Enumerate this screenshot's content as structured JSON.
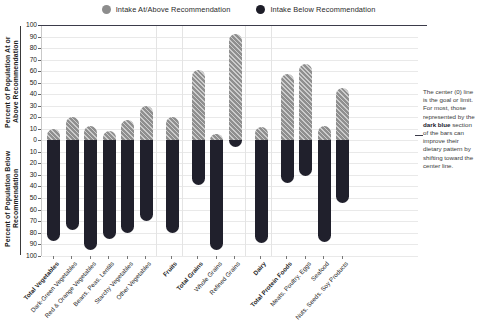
{
  "legend": {
    "items": [
      {
        "label": "Intake At/Above Recommendation",
        "icon": "circle-icon",
        "color": "#8d8d8d"
      },
      {
        "label": "Intake Below Recommendation",
        "icon": "circle-icon",
        "color": "#1d1d28"
      }
    ]
  },
  "axis": {
    "title_above": "Percent of Population At or Above Recommendation",
    "title_below": "Percent of Population Below Recommendation",
    "ticks_above": [
      "100",
      "90",
      "80",
      "70",
      "60",
      "50",
      "40",
      "30",
      "20",
      "10",
      "0"
    ],
    "ticks_below": [
      "10",
      "20",
      "30",
      "40",
      "50",
      "60",
      "70",
      "80",
      "90",
      "100"
    ]
  },
  "annotation": {
    "line1": "The center (0) line is the goal or limit. For most, those represented by the ",
    "bold": "dark blue",
    "line2": " section of the bars can improve their dietary pattern by shifting toward the center line."
  },
  "chart_data": {
    "type": "bar",
    "title": "",
    "xlabel": "",
    "ylabel": "Percent of Population",
    "ylim": [
      -100,
      100
    ],
    "grid": true,
    "legend_position": "top",
    "categories": [
      "Total Vegetables",
      "Dark-Green Vegetables",
      "Red & Orange Vegetables",
      "Beans, Peas, Lentils",
      "Starchy Vegetables",
      "Other Vegetables",
      "Fruits",
      "Total Grains",
      "Whole Grains",
      "Refined Grains",
      "Dairy",
      "Total Protein Foods",
      "Meats, Poultry, Eggs",
      "Seafood",
      "Nuts, Seeds, Soy Products"
    ],
    "bold_categories": [
      "Total Vegetables",
      "Fruits",
      "Total Grains",
      "Dairy",
      "Total Protein Foods"
    ],
    "groups": [
      {
        "name": "Vegetables",
        "members": [
          "Total Vegetables",
          "Dark-Green Vegetables",
          "Red & Orange Vegetables",
          "Beans, Peas, Lentils",
          "Starchy Vegetables",
          "Other Vegetables"
        ]
      },
      {
        "name": "Fruits",
        "members": [
          "Fruits"
        ]
      },
      {
        "name": "Grains",
        "members": [
          "Total Grains",
          "Whole Grains",
          "Refined Grains"
        ]
      },
      {
        "name": "Dairy",
        "members": [
          "Dairy"
        ]
      },
      {
        "name": "Protein Foods",
        "members": [
          "Total Protein Foods",
          "Meats, Poultry, Eggs",
          "Seafood",
          "Nuts, Seeds, Soy Products"
        ]
      }
    ],
    "series": [
      {
        "name": "Intake At/Above Recommendation",
        "color": "#8f8f8f",
        "values": [
          10,
          20,
          12,
          8,
          17,
          30,
          20,
          61,
          5,
          92,
          11,
          57,
          66,
          12,
          45
        ]
      },
      {
        "name": "Intake Below Recommendation",
        "color": "#20202c",
        "values": [
          87,
          78,
          95,
          85,
          80,
          70,
          80,
          39,
          95,
          6,
          89,
          37,
          31,
          88,
          54
        ]
      }
    ]
  }
}
